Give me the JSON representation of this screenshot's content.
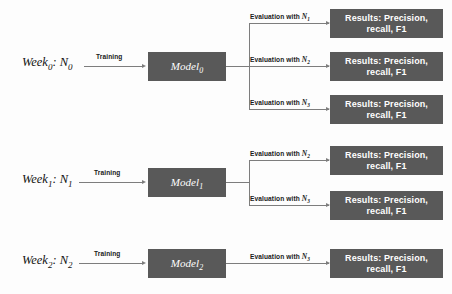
{
  "diagram": {
    "type": "flowchart",
    "colors": {
      "box_fill": "#595959",
      "box_text": "#ffffff",
      "line": "#7d7d7d",
      "label_text": "#1a1a1a",
      "background": "#fdfdfd"
    },
    "rows": [
      {
        "id": "week0",
        "source_label": "Week",
        "source_sub": "0",
        "source_value": "N",
        "source_value_sub": "0",
        "training_label": "Training",
        "model_label": "Model",
        "model_sub": "0",
        "branches": [
          {
            "eval_prefix": "Evaluation with ",
            "eval_var": "N",
            "eval_sub": "1",
            "result_line1": "Results: Precision,",
            "result_line2": "recall, F1"
          },
          {
            "eval_prefix": "Evaluation with ",
            "eval_var": "N",
            "eval_sub": "2",
            "result_line1": "Results: Precision,",
            "result_line2": "recall, F1"
          },
          {
            "eval_prefix": "Evaluation with ",
            "eval_var": "N",
            "eval_sub": "3",
            "result_line1": "Results: Precision,",
            "result_line2": "recall, F1"
          }
        ]
      },
      {
        "id": "week1",
        "source_label": "Week",
        "source_sub": "1",
        "source_value": "N",
        "source_value_sub": "1",
        "training_label": "Training",
        "model_label": "Model",
        "model_sub": "1",
        "branches": [
          {
            "eval_prefix": "Evaluation with ",
            "eval_var": "N",
            "eval_sub": "2",
            "result_line1": "Results: Precision,",
            "result_line2": "recall, F1"
          },
          {
            "eval_prefix": "Evaluation with ",
            "eval_var": "N",
            "eval_sub": "3",
            "result_line1": "Results: Precision,",
            "result_line2": "recall, F1"
          }
        ]
      },
      {
        "id": "week2",
        "source_label": "Week",
        "source_sub": "2",
        "source_value": "N",
        "source_value_sub": "2",
        "training_label": "Training",
        "model_label": "Model",
        "model_sub": "2",
        "branches": [
          {
            "eval_prefix": "Evaluation with ",
            "eval_var": "N",
            "eval_sub": "3",
            "result_line1": "Results: Precision,",
            "result_line2": "recall, F1"
          }
        ]
      }
    ]
  }
}
